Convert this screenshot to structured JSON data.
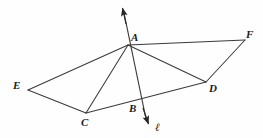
{
  "figure": {
    "kind": "geometry-diagram",
    "background_color": "#fefefe",
    "stroke_color": "#3a3a3a",
    "label_color": "#1b1b1b",
    "width": 263,
    "height": 138
  },
  "points": {
    "A": {
      "label": "A",
      "x": 128,
      "y": 45,
      "label_x": 131,
      "label_y": 32
    },
    "B": {
      "label": "B",
      "x": 139,
      "y": 103,
      "label_x": 129,
      "label_y": 103
    },
    "C": {
      "label": "C",
      "x": 86,
      "y": 113,
      "label_x": 81,
      "label_y": 117
    },
    "D": {
      "label": "D",
      "x": 206,
      "y": 82,
      "label_x": 209,
      "label_y": 83
    },
    "E": {
      "label": "E",
      "x": 28,
      "y": 90,
      "label_x": 13,
      "label_y": 80
    },
    "F": {
      "label": "F",
      "x": 245,
      "y": 40,
      "label_x": 246,
      "label_y": 29
    },
    "arrow_up": {
      "x": 121,
      "y": 6
    },
    "arrow_down": {
      "x": 150,
      "y": 126
    }
  },
  "line_label": {
    "text": "ℓ",
    "x": 155,
    "y": 122
  },
  "segments": [
    {
      "name": "segment-A-E",
      "from": "A",
      "to": "E"
    },
    {
      "name": "segment-A-C",
      "from": "A",
      "to": "C"
    },
    {
      "name": "segment-A-D",
      "from": "A",
      "to": "D"
    },
    {
      "name": "segment-A-F",
      "from": "A",
      "to": "F"
    },
    {
      "name": "segment-E-C",
      "from": "E",
      "to": "C"
    },
    {
      "name": "segment-C-B",
      "from": "C",
      "to": "B"
    },
    {
      "name": "segment-B-D",
      "from": "B",
      "to": "D"
    },
    {
      "name": "segment-D-F",
      "from": "D",
      "to": "F"
    }
  ],
  "ray_line": {
    "name": "line-ell",
    "description": "double-headed arrow line through A and B"
  }
}
